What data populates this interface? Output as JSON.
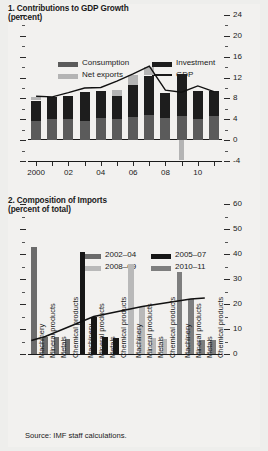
{
  "source_note": "Source: IMF staff calculations.",
  "colors": {
    "consumption": "#5b5b5b",
    "investment": "#1d1d1d",
    "net_exports": "#b4b4b4",
    "gdp_line": "#111111",
    "p2_2002_04": "#6b6b6b",
    "p2_2005_07": "#161616",
    "p2_2008_09": "#b9b9b9",
    "p2_2010_11": "#7e7e7e",
    "axis": "#1a1a1a",
    "background": "#f2f1ef"
  },
  "panel1": {
    "title": "1. Contributions to GDP Growth",
    "subtitle": "(percent)",
    "legend": [
      {
        "label": "Consumption",
        "type": "swatch",
        "color": "#5b5b5b"
      },
      {
        "label": "Investment",
        "type": "swatch",
        "color": "#1d1d1d"
      },
      {
        "label": "Net exports",
        "type": "swatch",
        "color": "#b4b4b4"
      },
      {
        "label": "GDP",
        "type": "line",
        "color": "#111111"
      }
    ]
  },
  "panel2": {
    "title": "2. Composition of Imports",
    "subtitle": "(percent of total)",
    "legend": [
      {
        "label": "2002–04",
        "color": "#6b6b6b"
      },
      {
        "label": "2005–07",
        "color": "#161616"
      },
      {
        "label": "2008–09",
        "color": "#b9b9b9"
      },
      {
        "label": "2010–11",
        "color": "#7e7e7e"
      }
    ]
  },
  "chart_data": [
    {
      "type": "bar",
      "title": "1. Contributions to GDP Growth",
      "subtitle": "(percent)",
      "xlabel": "",
      "ylabel": "percent",
      "ylim": [
        -4,
        24
      ],
      "yticks": [
        -4,
        0,
        4,
        8,
        12,
        16,
        20,
        24
      ],
      "ytick_labels": [
        "-4",
        "0",
        "4",
        "8",
        "12",
        "16",
        "20",
        "24"
      ],
      "minor_ticks": true,
      "grid": false,
      "legend_position": "top",
      "stacked": true,
      "x": [
        2000,
        2001,
        2002,
        2003,
        2004,
        2005,
        2006,
        2007,
        2008,
        2009,
        2010,
        2011
      ],
      "xtick_labels": [
        "2000",
        "",
        "02",
        "",
        "04",
        "",
        "06",
        "",
        "08",
        "",
        "10",
        ""
      ],
      "series": [
        {
          "name": "Consumption",
          "color": "#5b5b5b",
          "values": [
            3.6,
            4.0,
            4.0,
            3.7,
            4.2,
            4.0,
            4.4,
            4.8,
            4.2,
            4.6,
            4.0,
            4.6
          ]
        },
        {
          "name": "Investment",
          "color": "#1d1d1d",
          "values": [
            4.0,
            4.2,
            4.4,
            5.5,
            5.2,
            4.5,
            6.2,
            7.6,
            4.9,
            8.1,
            5.4,
            4.8
          ]
        },
        {
          "name": "Net exports",
          "color": "#b4b4b4",
          "values": [
            0.6,
            0.0,
            0.0,
            0.0,
            0.0,
            1.2,
            1.9,
            1.6,
            0.0,
            -3.8,
            0.0,
            0.0
          ]
        }
      ],
      "line_series": [
        {
          "name": "GDP",
          "color": "#111111",
          "values": [
            8.4,
            8.3,
            9.1,
            10.0,
            10.1,
            11.3,
            12.7,
            14.2,
            9.6,
            9.2,
            10.4,
            9.3
          ]
        }
      ]
    },
    {
      "type": "bar",
      "title": "2. Composition of Imports",
      "subtitle": "(percent of total)",
      "xlabel": "",
      "ylabel": "percent of total",
      "ylim": [
        0,
        60
      ],
      "yticks": [
        0,
        10,
        20,
        30,
        40,
        50,
        60
      ],
      "ytick_labels": [
        "0",
        "10",
        "20",
        "30",
        "40",
        "50",
        "60"
      ],
      "minor_ticks": true,
      "grid": false,
      "legend_position": "top",
      "categories": [
        "Machinery",
        "Mineral products",
        "Metals",
        "Chemical products"
      ],
      "groups": [
        {
          "name": "2002–04",
          "color": "#6b6b6b",
          "values": [
            43.0,
            7.0,
            7.0,
            6.0
          ]
        },
        {
          "name": "2005–07",
          "color": "#161616",
          "values": [
            41.0,
            15.0,
            7.0,
            6.5
          ]
        },
        {
          "name": "2008–09",
          "color": "#b9b9b9",
          "values": [
            36.0,
            19.0,
            6.5,
            6.0
          ]
        },
        {
          "name": "2010–11",
          "color": "#7e7e7e",
          "values": [
            33.0,
            22.0,
            5.5,
            5.5
          ]
        }
      ],
      "axis_category_labels": [
        "Machinery",
        "Mineral products",
        "Metals",
        "Chemical products",
        "Machinery",
        "Mineral products",
        "Metals",
        "Chemical products",
        "Machinery",
        "Mineral products",
        "Metals",
        "Chemical products",
        "Machinery",
        "Mineral products",
        "Metals",
        "Chemical products"
      ],
      "line_series": [
        {
          "name": "Mineral products trend",
          "color": "#111111",
          "values": [
            7.0,
            15.0,
            19.0,
            22.0
          ]
        }
      ]
    }
  ]
}
